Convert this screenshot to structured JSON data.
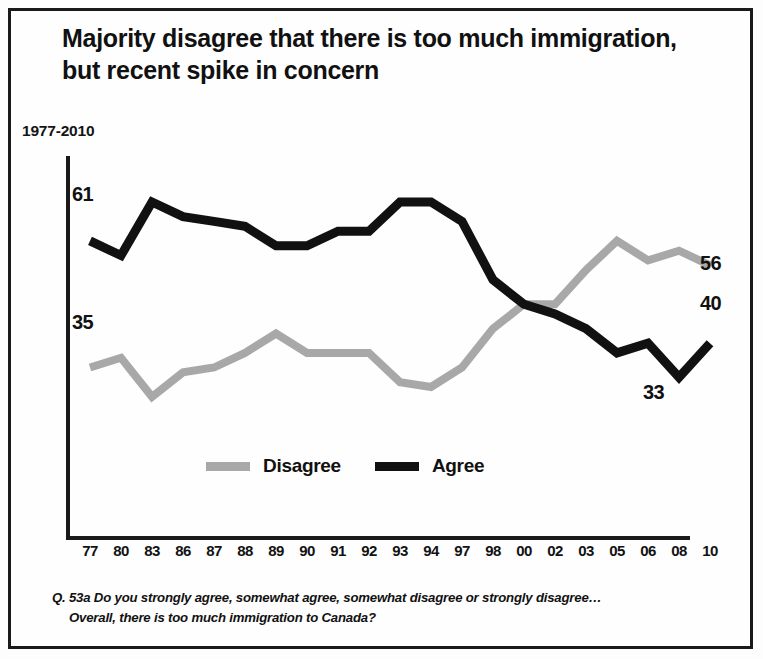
{
  "title": {
    "line1": "Majority disagree that there is too much immigration,",
    "line2": "but recent spike in concern"
  },
  "period_label": "1977-2010",
  "legend": {
    "disagree": "Disagree",
    "agree": "Agree",
    "disagree_color": "#a8a8a8",
    "agree_color": "#111111"
  },
  "endpoint_labels": {
    "agree_start": "61",
    "disagree_start": "35",
    "disagree_end": "56",
    "agree_end": "40",
    "agree_low": "33"
  },
  "footnote": {
    "line1": "Q. 53a  Do you strongly agree, somewhat agree, somewhat disagree or strongly disagree…",
    "line2": "Overall, there is too much immigration to Canada?"
  },
  "chart_data": {
    "type": "line",
    "title": "Majority disagree that there is too much immigration, but recent spike in concern",
    "subtitle": "1977-2010",
    "xlabel": "",
    "ylabel": "",
    "ylim": [
      0,
      78
    ],
    "grid": false,
    "legend_position": "bottom-center",
    "categories": [
      "77",
      "80",
      "83",
      "86",
      "87",
      "88",
      "89",
      "90",
      "91",
      "92",
      "93",
      "94",
      "97",
      "98",
      "00",
      "02",
      "03",
      "05",
      "06",
      "08",
      "10"
    ],
    "series": [
      {
        "name": "Agree",
        "color": "#111111",
        "values": [
          61,
          58,
          69,
          66,
          65,
          64,
          60,
          60,
          63,
          63,
          69,
          69,
          65,
          53,
          48,
          46,
          43,
          38,
          40,
          33,
          40
        ]
      },
      {
        "name": "Disagree",
        "color": "#a8a8a8",
        "values": [
          35,
          37,
          29,
          34,
          35,
          38,
          42,
          38,
          38,
          38,
          32,
          31,
          35,
          43,
          48,
          48,
          55,
          61,
          57,
          59,
          56
        ]
      }
    ],
    "annotations": [
      {
        "text": "61",
        "series": "Agree",
        "at": "77",
        "position": "left"
      },
      {
        "text": "35",
        "series": "Disagree",
        "at": "77",
        "position": "left"
      },
      {
        "text": "56",
        "series": "Disagree",
        "at": "10",
        "position": "right"
      },
      {
        "text": "40",
        "series": "Agree",
        "at": "10",
        "position": "right"
      },
      {
        "text": "33",
        "series": "Agree",
        "at": "08",
        "position": "below"
      }
    ],
    "footnote": "Q. 53a  Do you strongly agree, somewhat agree, somewhat disagree or strongly disagree… Overall, there is too much immigration to Canada?"
  },
  "axis": {
    "origin_x": 68,
    "origin_y": 538,
    "top_y": 158,
    "right_x": 688,
    "x_step": 31,
    "x_first": 90,
    "y_zero": 538,
    "y_scale": 4.87
  }
}
